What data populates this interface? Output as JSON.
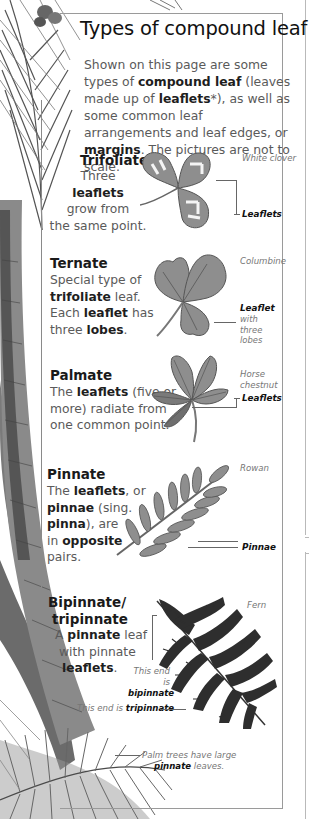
{
  "page": {
    "title": "Types of compound leaf",
    "intro": {
      "t1": "Shown on this page are some types of ",
      "b1": "compound leaf",
      "t2": " (leaves made up of ",
      "b2": "leaflets",
      "t3": "*), as well as some common leaf arrangements and leaf edges, or ",
      "b3": "margins",
      "t4": ". The pictures are not to scale."
    }
  },
  "sections": {
    "trifoliate": {
      "heading": "Trifoliate",
      "l1": "Three",
      "l2": "leaflets",
      "l3": "grow from",
      "l4": "the same point.",
      "plant": "White clover",
      "label": "Leaflets"
    },
    "ternate": {
      "heading": "Ternate",
      "l1": "Special type of",
      "l2b": "trifoliate",
      "l2": " leaf.",
      "l3a": "Each ",
      "l3b": "leaflet",
      "l3c": " has",
      "l4a": "three ",
      "l4b": "lobes",
      "l4c": ".",
      "plant": "Columbine",
      "label": "Leaflet",
      "label_sub": "with three lobes"
    },
    "palmate": {
      "heading": "Palmate",
      "l1a": "The ",
      "l1b": "leaflets",
      "l1c": " (five or",
      "l2": "more) radiate from",
      "l3": "one common point.",
      "plant": "Horse chestnut",
      "label": "Leaflets"
    },
    "pinnate": {
      "heading": "Pinnate",
      "l1a": "The ",
      "l1b": "leaflets",
      "l1c": ", or",
      "l2b": "pinnae",
      "l2c": " (sing.",
      "l3b": "pinna",
      "l3c": "), are",
      "l4a": "in ",
      "l4b": "opposite",
      "l5": "pairs.",
      "plant": "Rowan",
      "label": "Pinnae"
    },
    "bipinnate": {
      "heading1": "Bipinnate/",
      "heading2": "tripinnate",
      "l1a": "A ",
      "l1b": "pinnate",
      "l1c": " leaf",
      "l2": "with pinnate",
      "l3b": "leaflets",
      "l3c": ".",
      "plant": "Fern",
      "bip_label_1": "This end is",
      "bip_label_2": "bipinnate",
      "trip_label_1": "This end is ",
      "trip_label_2": "tripinnate"
    }
  },
  "palm_caption": {
    "l1": "Palm trees have large",
    "l2b": "pinnate",
    "l2c": " leaves."
  },
  "colors": {
    "leaf_fill": "#8e8e8e",
    "leaf_dark": "#5c5c5c",
    "text_body": "#5a5a5a",
    "text_bold": "#1a1a1a",
    "border": "#9a9a9a"
  }
}
